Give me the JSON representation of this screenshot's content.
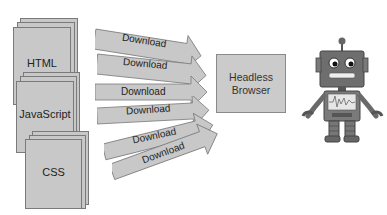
{
  "diagram": {
    "resources": [
      {
        "label": "HTML"
      },
      {
        "label": "JavaScript"
      },
      {
        "label": "CSS"
      }
    ],
    "arrows": [
      {
        "label": "Download"
      },
      {
        "label": "Download"
      },
      {
        "label": "Download"
      },
      {
        "label": "Download"
      },
      {
        "label": "Download"
      },
      {
        "label": "Download"
      }
    ],
    "target": {
      "line1": "Headless",
      "line2": "Browser"
    },
    "robot": {
      "name": "robot-illustration"
    },
    "colors": {
      "fill": "#c8c8c8",
      "stroke": "#7a7a7a",
      "text": "#222222"
    }
  }
}
